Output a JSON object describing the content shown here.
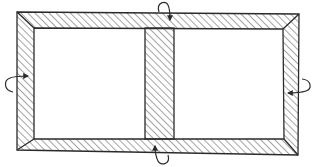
{
  "diagram": {
    "title": "Hatched window frame with central mullion and four curved rotation arrows",
    "colors": {
      "background": "#ffffff",
      "stroke": "#2a2a2a",
      "hatch": "#4a4a4a"
    },
    "frame": {
      "outer": [
        [
          17,
          12
        ],
        [
          299,
          14
        ],
        [
          298,
          155
        ],
        [
          17,
          150
        ]
      ],
      "inner": [
        [
          34,
          28
        ],
        [
          283,
          29
        ],
        [
          284,
          139
        ],
        [
          34,
          139
        ]
      ],
      "mullion": {
        "x_left": 145,
        "x_right": 174,
        "y_top": 28,
        "y_bottom": 139
      }
    },
    "arrows": [
      {
        "id": "top",
        "position": "top-center",
        "direction": "down",
        "label": "rotation-arrow-top"
      },
      {
        "id": "bottom",
        "position": "bottom-center",
        "direction": "up",
        "label": "rotation-arrow-bottom"
      },
      {
        "id": "left",
        "position": "left-middle",
        "direction": "right",
        "label": "rotation-arrow-left"
      },
      {
        "id": "right",
        "position": "right-middle",
        "direction": "left",
        "label": "rotation-arrow-right"
      }
    ]
  }
}
